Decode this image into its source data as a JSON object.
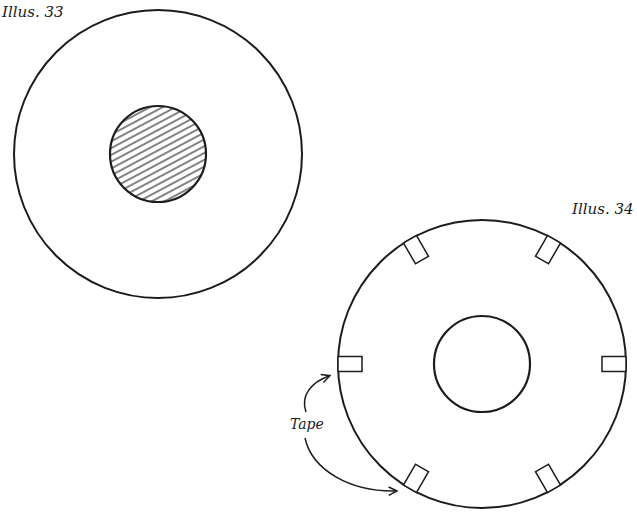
{
  "illustrations": [
    {
      "label": "Illus. 33",
      "outer_circle": {
        "cx": 158,
        "cy": 154,
        "r": 144
      },
      "inner_circle": {
        "cx": 158,
        "cy": 154,
        "r": 48,
        "fill": "hatched"
      }
    },
    {
      "label": "Illus. 34",
      "outer_circle": {
        "cx": 482,
        "cy": 364,
        "r": 144
      },
      "inner_circle": {
        "cx": 482,
        "cy": 364,
        "r": 48,
        "fill": "none"
      },
      "tape_tabs": 6,
      "annotation": "Tape"
    }
  ],
  "colors": {
    "stroke": "#1c1c1c",
    "background": "#ffffff"
  }
}
